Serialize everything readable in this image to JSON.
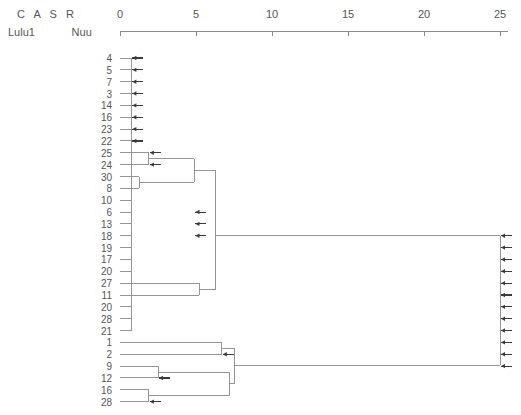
{
  "header": {
    "row1": "C   A   S   R",
    "row2": "Lulu1            Nuu",
    "row1_cells": [
      "C",
      "A",
      "S",
      "R"
    ],
    "row2_cells": [
      "Lulu1",
      "Nuu"
    ]
  },
  "axis": {
    "ticks": [
      0,
      5,
      10,
      15,
      20,
      25
    ],
    "tick_labels": [
      "0",
      "5",
      "10",
      "15",
      "20",
      "25"
    ],
    "range": [
      0,
      25
    ],
    "orientation": "top",
    "x_start_px": 120,
    "px_per_unit": 15.2,
    "color": "#8a8a8a"
  },
  "style": {
    "line_color": "#8a8a8a",
    "arrow_color": "#3a3a3a",
    "text_color": "#555555",
    "background": "#ffffff"
  },
  "chart_data": {
    "type": "dendrogram",
    "title": "",
    "xlabel": "",
    "ylabel": "",
    "xlim": [
      0,
      25
    ],
    "grid": false,
    "legend": "none",
    "orientation": "horizontal-right",
    "leaf_order": [
      4,
      5,
      7,
      3,
      14,
      16,
      23,
      22,
      25,
      24,
      30,
      8,
      10,
      6,
      13,
      18,
      19,
      17,
      20,
      27,
      11,
      20,
      28,
      21,
      1,
      2,
      9,
      12,
      16,
      28
    ],
    "leaf_labels": [
      "4",
      "5",
      "7",
      "3",
      "14",
      "16",
      "23",
      "22",
      "25",
      "24",
      "30",
      "8",
      "10",
      "6",
      "13",
      "18",
      "19",
      "17",
      "20",
      "27",
      "11",
      "20",
      "28",
      "21",
      "1",
      "2",
      "9",
      "12",
      "16",
      "28"
    ],
    "leaf_count": 30,
    "leaf_stub_distance": 0.75,
    "merges": [
      {
        "id": "m-25-24",
        "members": [
          9,
          10
        ],
        "distance": 1.9
      },
      {
        "id": "m-30-8",
        "members": [
          11,
          12
        ],
        "distance": 1.25
      },
      {
        "id": "m-upper-a",
        "members": [
          9,
          10,
          11,
          12
        ],
        "distance": 4.9
      },
      {
        "id": "m-27-11",
        "members": [
          20,
          21
        ],
        "distance": 5.2
      },
      {
        "id": "m-mid-block",
        "members": [
          1,
          2,
          3,
          4,
          5,
          6,
          7,
          8,
          13,
          14,
          15,
          16,
          17,
          18,
          19,
          22,
          23,
          24
        ],
        "distance": 6.3
      },
      {
        "id": "m-9-12",
        "members": [
          27,
          28
        ],
        "distance": 2.5
      },
      {
        "id": "m-16-28",
        "members": [
          29,
          30
        ],
        "distance": 1.9
      },
      {
        "id": "m-lower-b",
        "members": [
          27,
          28,
          29,
          30
        ],
        "distance": 7.2
      },
      {
        "id": "m-1-2-block",
        "members": [
          25,
          26
        ],
        "distance": 6.7
      },
      {
        "id": "m-lower-root",
        "members": [
          25,
          26,
          27,
          28,
          29,
          30
        ],
        "distance": 7.5
      },
      {
        "id": "m-root",
        "members": "all",
        "distance": 25.0
      }
    ]
  }
}
